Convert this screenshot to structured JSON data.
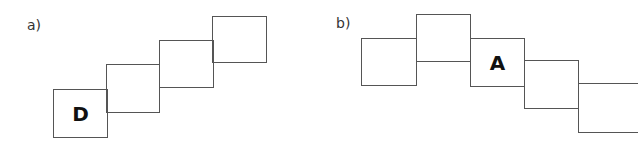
{
  "figures": [
    {
      "label": "a)",
      "squares": [
        {
          "letter": "D"
        },
        {
          "letter": ""
        },
        {
          "letter": ""
        },
        {
          "letter": ""
        }
      ]
    },
    {
      "label": "b)",
      "squares": [
        {
          "letter": ""
        },
        {
          "letter": ""
        },
        {
          "letter": "A"
        },
        {
          "letter": ""
        },
        {
          "letter": ""
        }
      ]
    }
  ]
}
